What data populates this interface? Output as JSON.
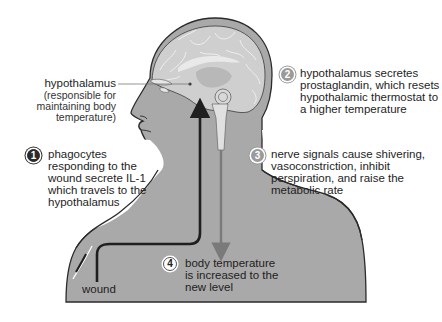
{
  "figure": {
    "colors": {
      "body_fill": "#a9a9a9",
      "body_outline": "#2b2b2b",
      "brain_fill": "#cfcfcf",
      "brain_folds": "#f2f2f2",
      "wound_path_arrow": "#1f1f1f",
      "spinal_arrow": "#7a7a7a",
      "background": "#ffffff"
    }
  },
  "labels": {
    "hypothalamus": {
      "title": "hypothalamus",
      "note_lines": [
        "(responsible for",
        "maintaining body",
        "temperature)"
      ]
    },
    "wound": "wound"
  },
  "steps": [
    {
      "number": "1",
      "style": "dark",
      "lines": [
        "phagocytes",
        "responding to the",
        "wound secrete IL-1",
        "which travels to the",
        "hypothalamus"
      ]
    },
    {
      "number": "2",
      "style": "grey",
      "lines": [
        "hypothalamus secretes",
        "prostaglandin, which resets",
        "hypothalamic thermostat to",
        "a higher temperature"
      ]
    },
    {
      "number": "3",
      "style": "grey",
      "lines": [
        "nerve signals cause shivering,",
        "vasoconstriction, inhibit",
        "perspiration, and raise the",
        "metabolic rate"
      ]
    },
    {
      "number": "4",
      "style": "white",
      "lines": [
        "body temperature",
        "is increased to the",
        "new level"
      ]
    }
  ]
}
